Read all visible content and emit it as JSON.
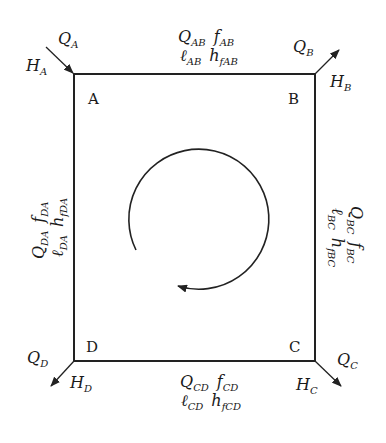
{
  "diagram": {
    "type": "pipe-network-loop",
    "colors": {
      "line": "#222222",
      "background": "#ffffff"
    },
    "nodes": {
      "A": {
        "label": "A",
        "flow": {
          "sym": "Q",
          "sub": "A"
        },
        "head": {
          "sym": "H",
          "sub": "A"
        }
      },
      "B": {
        "label": "B",
        "flow": {
          "sym": "Q",
          "sub": "B"
        },
        "head": {
          "sym": "H",
          "sub": "B"
        }
      },
      "C": {
        "label": "C",
        "flow": {
          "sym": "Q",
          "sub": "C"
        },
        "head": {
          "sym": "H",
          "sub": "C"
        }
      },
      "D": {
        "label": "D",
        "flow": {
          "sym": "Q",
          "sub": "D"
        },
        "head": {
          "sym": "H",
          "sub": "D"
        }
      }
    },
    "pipes": {
      "AB": {
        "Q": "Q",
        "Q_sub": "AB",
        "f": "f",
        "f_sub": "AB",
        "l": "ℓ",
        "l_sub": "AB",
        "h": "h",
        "h_sub": "fAB"
      },
      "BC": {
        "Q": "Q",
        "Q_sub": "BC",
        "f": "f",
        "f_sub": "BC",
        "l": "ℓ",
        "l_sub": "BC",
        "h": "h",
        "h_sub": "fBC"
      },
      "CD": {
        "Q": "Q",
        "Q_sub": "CD",
        "f": "f",
        "f_sub": "CD",
        "l": "ℓ",
        "l_sub": "CD",
        "h": "h",
        "h_sub": "fCD"
      },
      "DA": {
        "Q": "Q",
        "Q_sub": "DA",
        "f": "f",
        "f_sub": "DA",
        "l": "ℓ",
        "l_sub": "DA",
        "h": "h",
        "h_sub": "fDA"
      }
    },
    "loop_direction": "clockwise"
  }
}
